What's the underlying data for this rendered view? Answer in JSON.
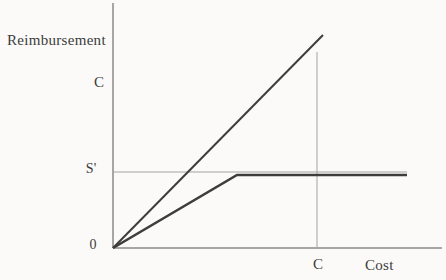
{
  "chart_data": {
    "type": "line",
    "title": "",
    "xlabel": "Cost",
    "ylabel": "Reimbursement",
    "origin_label": "0",
    "y_ticks": [
      {
        "label": "C",
        "y_px": 82
      },
      {
        "label": "S'",
        "y_px": 169
      }
    ],
    "x_ticks": [
      {
        "label": "C",
        "x_px": 317
      }
    ],
    "axis_ranges": {
      "x": "unscaled (conceptual)",
      "y": "unscaled (conceptual)"
    },
    "grid": "off",
    "legend": "none",
    "colors": {
      "axis": "#8a8a8a",
      "reference": "#a3a3a3",
      "line_dark": "#3d3d3d",
      "text": "#3c3c3c",
      "background": "#fbfaf8"
    },
    "lines": [
      {
        "name": "y-axis-line",
        "color_key": "axis",
        "width": 1.5,
        "points": [
          [
            113,
            3
          ],
          [
            113,
            248
          ]
        ]
      },
      {
        "name": "x-axis-line",
        "color_key": "axis",
        "width": 1.5,
        "points": [
          [
            113,
            248
          ],
          [
            442,
            248
          ]
        ]
      },
      {
        "name": "s-prime-reference-line",
        "color_key": "reference",
        "width": 1,
        "points": [
          [
            113,
            172
          ],
          [
            407,
            172
          ]
        ]
      },
      {
        "name": "cost-c-vertical-reference-line",
        "color_key": "reference",
        "width": 1,
        "points": [
          [
            317,
            52
          ],
          [
            317,
            248
          ]
        ]
      },
      {
        "name": "full-cost-reimbursement-line",
        "color_key": "line_dark",
        "width": 2,
        "points": [
          [
            113,
            248
          ],
          [
            323,
            35
          ]
        ]
      },
      {
        "name": "capped-reimbursement-line",
        "color_key": "line_dark",
        "width": 2.6,
        "points": [
          [
            113,
            248
          ],
          [
            237,
            175
          ],
          [
            407,
            175
          ]
        ]
      }
    ]
  }
}
